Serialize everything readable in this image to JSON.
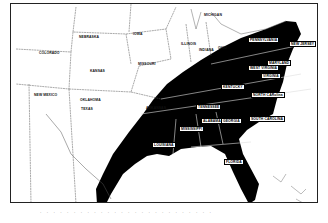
{
  "map": {
    "title": "",
    "shaded_region_color": "#000000",
    "background_color": "#ffffff",
    "border_color": "#222222",
    "states_unshaded": [
      {
        "name": "COLORADO",
        "x": 28,
        "y": 47
      },
      {
        "name": "NEBRASKA",
        "x": 68,
        "y": 31
      },
      {
        "name": "IOWA",
        "x": 122,
        "y": 28
      },
      {
        "name": "KANSAS",
        "x": 79,
        "y": 65
      },
      {
        "name": "MISSOURI",
        "x": 127,
        "y": 58
      },
      {
        "name": "NEW MEXICO",
        "x": 23,
        "y": 89
      },
      {
        "name": "OKLAHOMA",
        "x": 69,
        "y": 94
      },
      {
        "name": "TEXAS",
        "x": 70,
        "y": 103
      },
      {
        "name": "ARKANSAS",
        "x": 135,
        "y": 102
      },
      {
        "name": "ILLINOIS",
        "x": 170,
        "y": 38
      },
      {
        "name": "INDIANA",
        "x": 188,
        "y": 44
      },
      {
        "name": "OHIO",
        "x": 207,
        "y": 42
      },
      {
        "name": "MICHIGAN",
        "x": 193,
        "y": 9
      }
    ],
    "states_shaded": [
      {
        "name": "PENNSYLVANIA",
        "x": 237,
        "y": 33
      },
      {
        "name": "NEW JERSEY",
        "x": 278,
        "y": 37
      },
      {
        "name": "MARYLAND",
        "x": 256,
        "y": 56
      },
      {
        "name": "WEST VIRGINIA",
        "x": 237,
        "y": 61
      },
      {
        "name": "VIRGINIA",
        "x": 250,
        "y": 69
      },
      {
        "name": "KENTUCKY",
        "x": 210,
        "y": 80
      },
      {
        "name": "TENNESSEE",
        "x": 185,
        "y": 100
      },
      {
        "name": "NORTH CARolina",
        "x": 240,
        "y": 88
      },
      {
        "name": "SOUTH CAROLINA",
        "x": 238,
        "y": 112
      },
      {
        "name": "MISSISSIPPI",
        "x": 168,
        "y": 122
      },
      {
        "name": "ALABAMA",
        "x": 190,
        "y": 114
      },
      {
        "name": "GEORGIA",
        "x": 210,
        "y": 114
      },
      {
        "name": "LOUISIANA",
        "x": 141,
        "y": 138
      },
      {
        "name": "FLORIDA",
        "x": 213,
        "y": 155
      }
    ],
    "caption": ". . .   . . . .   . . . . . . . .   . . . . . .   . . . . ."
  }
}
